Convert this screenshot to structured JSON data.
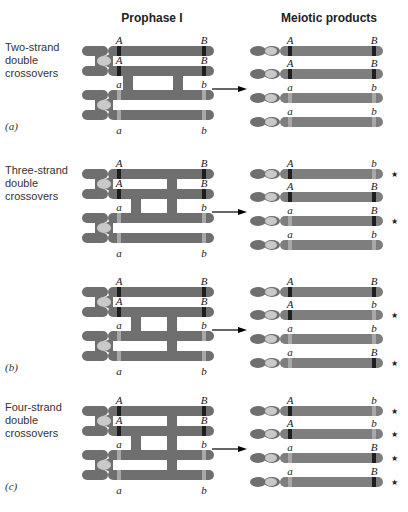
{
  "headers": {
    "left": "Prophase I",
    "right": "Meiotic products"
  },
  "colors": {
    "chromosome": "#6f6f6f",
    "chromosome_light": "#7e7e7e",
    "centromere": "#c9c9c9",
    "dominant_band": "#1e1e1e",
    "recessive_band": "#a8a8a8",
    "arrow": "#000000"
  },
  "panels": [
    {
      "id": "a",
      "part_label": "(a)",
      "side_label": [
        "Two-strand",
        "double",
        "crossovers"
      ],
      "prophase_labels": {
        "top": [
          "A",
          "B"
        ],
        "mid1": [
          "A",
          "B"
        ],
        "mid2": [
          "a",
          "b"
        ],
        "bottom": [
          "a",
          "b"
        ]
      },
      "products": [
        {
          "left": "A",
          "right": "B",
          "star": false
        },
        {
          "left": "A",
          "right": "B",
          "star": false
        },
        {
          "left": "a",
          "right": "b",
          "star": false
        },
        {
          "left": "a",
          "right": "b",
          "star": false
        }
      ]
    },
    {
      "id": "b1",
      "part_label": "",
      "side_label": [
        "Three-strand",
        "double",
        "crossovers"
      ],
      "prophase_labels": {
        "top": [
          "A",
          "B"
        ],
        "mid1": [
          "A",
          "B"
        ],
        "mid2": [
          "a",
          "b"
        ],
        "bottom": [
          "a",
          "b"
        ]
      },
      "products": [
        {
          "left": "A",
          "right": "b",
          "star": true
        },
        {
          "left": "A",
          "right": "B",
          "star": false
        },
        {
          "left": "a",
          "right": "B",
          "star": true
        },
        {
          "left": "a",
          "right": "b",
          "star": false
        }
      ]
    },
    {
      "id": "b2",
      "part_label": "(b)",
      "side_label": [],
      "prophase_labels": {
        "top": [
          "A",
          "B"
        ],
        "mid1": [
          "A",
          "B"
        ],
        "mid2": [
          "a",
          "b"
        ],
        "bottom": [
          "a",
          "b"
        ]
      },
      "products": [
        {
          "left": "A",
          "right": "B",
          "star": false
        },
        {
          "left": "A",
          "right": "b",
          "star": true
        },
        {
          "left": "a",
          "right": "b",
          "star": false
        },
        {
          "left": "a",
          "right": "B",
          "star": true
        }
      ]
    },
    {
      "id": "c",
      "part_label": "(c)",
      "side_label": [
        "Four-strand",
        "double",
        "crossovers"
      ],
      "prophase_labels": {
        "top": [
          "A",
          "B"
        ],
        "mid1": [
          "A",
          "B"
        ],
        "mid2": [
          "a",
          "b"
        ],
        "bottom": [
          "a",
          "b"
        ]
      },
      "products": [
        {
          "left": "A",
          "right": "b",
          "star": true
        },
        {
          "left": "A",
          "right": "b",
          "star": true
        },
        {
          "left": "a",
          "right": "B",
          "star": true
        },
        {
          "left": "a",
          "right": "B",
          "star": true
        }
      ]
    }
  ],
  "star_symbol": "★"
}
